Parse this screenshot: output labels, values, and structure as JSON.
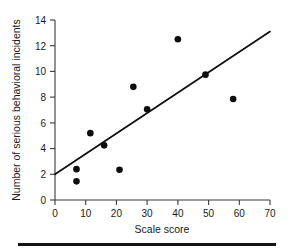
{
  "chart_data": {
    "type": "scatter",
    "title": "",
    "xlabel": "Scale score",
    "ylabel": "Number of serious behavioral incidents",
    "xlim": [
      0,
      70
    ],
    "ylim": [
      0,
      14
    ],
    "xticks": [
      0,
      10,
      20,
      30,
      40,
      50,
      60,
      70
    ],
    "yticks": [
      0,
      2,
      4,
      6,
      8,
      10,
      12,
      14
    ],
    "grid": false,
    "legend": "none",
    "points": [
      {
        "x": 7.0,
        "y": 2.4
      },
      {
        "x": 7.0,
        "y": 1.45
      },
      {
        "x": 11.5,
        "y": 5.2
      },
      {
        "x": 16.0,
        "y": 4.25
      },
      {
        "x": 21.0,
        "y": 2.35
      },
      {
        "x": 25.5,
        "y": 8.8
      },
      {
        "x": 30.0,
        "y": 7.05
      },
      {
        "x": 40.0,
        "y": 12.5
      },
      {
        "x": 49.0,
        "y": 9.75
      },
      {
        "x": 58.0,
        "y": 7.85
      }
    ],
    "trendline": {
      "x0": 0.0,
      "y0": 2.0,
      "x1": 70.0,
      "y1": 13.1
    },
    "marker_color": "#0d0d0d",
    "line_color": "#0d0d0d",
    "axis_color": "#3a3a3a"
  }
}
